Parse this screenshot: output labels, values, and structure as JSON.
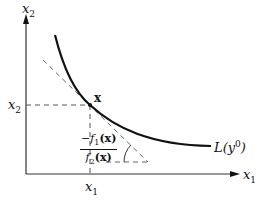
{
  "diagram": {
    "type": "isoquant-tangent",
    "axes": {
      "x_label": "x",
      "x_label_sub": "1",
      "y_label": "x",
      "y_label_sub": "2"
    },
    "point": {
      "label": "x",
      "x_tick_label": "x",
      "x_tick_sub": "1",
      "y_tick_label": "x",
      "y_tick_sub": "2"
    },
    "curve_label": {
      "text_pre": "L(y",
      "sup": "0",
      "text_post": ")"
    },
    "slope_label": {
      "numerator_prefix": "−f",
      "numerator_sub": "1",
      "numerator_arg": "(x)",
      "denominator_prefix": "f",
      "denominator_sub": "2",
      "denominator_arg": "(x)"
    },
    "colors": {
      "line": "#111111",
      "dashed": "#555555",
      "background": "#ffffff"
    }
  }
}
